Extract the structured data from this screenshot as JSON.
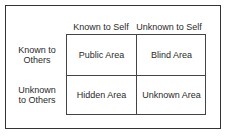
{
  "columns": [
    "Known to Self",
    "Unknown to Self"
  ],
  "rows": [
    {
      "label_line1": "Known to",
      "label_line2": "Others"
    },
    {
      "label_line1": "Unknown",
      "label_line2": "to Others"
    }
  ],
  "cells": [
    [
      "Public Area",
      "Blind Area"
    ],
    [
      "Hidden Area",
      "Unknown Area"
    ]
  ],
  "colors": {
    "line": "#444444",
    "text": "#2a2a2a",
    "background": "#ffffff"
  }
}
